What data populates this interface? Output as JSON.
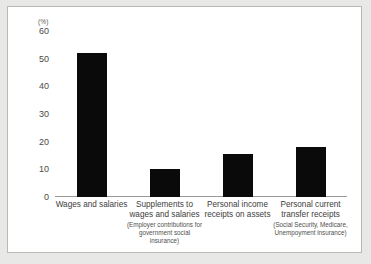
{
  "chart_data": {
    "type": "bar",
    "title": "",
    "subtitle": "",
    "xlabel": "",
    "ylabel": "",
    "unit_label": "(%)",
    "ylim": [
      0,
      60
    ],
    "ytick_values": [
      60,
      50,
      40,
      30,
      20,
      10,
      0
    ],
    "ytick_labels": [
      "60",
      "50",
      "40",
      "30",
      "20",
      "10",
      "0"
    ],
    "grid": false,
    "legend": "none",
    "bar_color": "#0a0a0a",
    "categories": [
      "Wages and salaries",
      "Supplements to wages and salaries",
      "Personal income receipts on assets",
      "Personal current transfer receipts"
    ],
    "category_sublabels": [
      "",
      "(Employer contributions for government social insurance)",
      "",
      "(Social Security, Medicare, Unempoyment insurance)"
    ],
    "values": [
      52,
      10,
      15.5,
      18
    ]
  },
  "x_axis": {
    "labels": [
      {
        "main": "Wages and salaries",
        "sub": ""
      },
      {
        "main": "Supplements to wages and salaries",
        "sub": "(Employer contributions for government social insurance)"
      },
      {
        "main": "Personal income receipts on assets",
        "sub": ""
      },
      {
        "main": "Personal current transfer receipts",
        "sub": "(Social Security, Medicare, Unempoyment insurance)"
      }
    ]
  },
  "y_axis": {
    "unit": "(%)",
    "ticks": [
      "60",
      "50",
      "40",
      "30",
      "20",
      "10",
      "0"
    ]
  }
}
